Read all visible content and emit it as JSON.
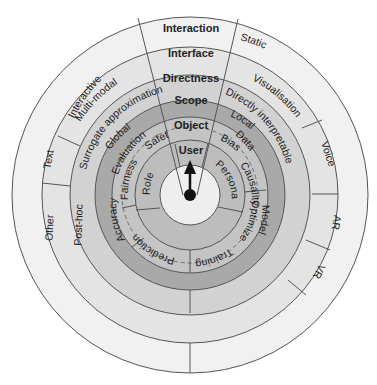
{
  "diagram": {
    "center": {
      "x": 190,
      "y": 195
    },
    "rings": [
      {
        "name": "interaction",
        "header": "Interaction",
        "r_outer": 178,
        "r_inner": 148,
        "fill": "#f1f1f1",
        "labels": [
          "Interactive",
          "Static"
        ]
      },
      {
        "name": "interface",
        "header": "Interface",
        "r_outer": 148,
        "r_inner": 120,
        "fill": "#e4e4e4",
        "labels": [
          "Multi-modal",
          "Visualisation",
          "Voice",
          "AR",
          "VR",
          "Text",
          "Other"
        ]
      },
      {
        "name": "directness",
        "header": "Directness",
        "r_outer": 120,
        "r_inner": 95,
        "fill": "#d2d2d2",
        "labels": [
          "Surrogate approximation",
          "Directly interpretable",
          "Post-hoc"
        ]
      },
      {
        "name": "scope",
        "header": "Scope",
        "r_outer": 95,
        "r_inner": 78,
        "fill": "#a9a9a9",
        "labels": [
          "Global",
          "Local"
        ]
      },
      {
        "name": "object",
        "header": "Object",
        "r_outer": 78,
        "r_inner": 55,
        "fill": "#c4c4c4",
        "labels": [
          "Evaluation",
          "Data",
          "Fairness",
          "Safety",
          "Bias",
          "Causality",
          "Accuracy",
          "Model",
          "Optimizer",
          "Training",
          "Prediction"
        ]
      },
      {
        "name": "user",
        "header": "User",
        "r_outer": 55,
        "r_inner": 30,
        "fill": "#bdbdbd",
        "labels": [
          "Role",
          "Persona"
        ]
      }
    ],
    "center_disc": {
      "fill": "#eeeeee",
      "pointer": "arrow-up"
    },
    "texts": {
      "interaction": "Interaction",
      "interface": "Interface",
      "directness": "Directness",
      "scope": "Scope",
      "object": "Object",
      "user": "User",
      "interactive": "Interactive",
      "static": "Static",
      "multimodal": "Multi-modal",
      "visualisation": "Visualisation",
      "voice": "Voice",
      "ar": "AR",
      "vr": "VR",
      "text": "Text",
      "other": "Other",
      "surrogate": "Surrogate approximation",
      "directly": "Directly interpretable",
      "posthoc": "Post-hoc",
      "global": "Global",
      "local": "Local",
      "evaluation": "Evaluation",
      "fairness": "Fairness",
      "safety": "Safety",
      "accuracy": "Accuracy",
      "data": "Data",
      "bias": "Bias",
      "causality": "Causality",
      "model": "Model",
      "optimizer": "Optimizer",
      "training": "Training",
      "prediction": "Prediction",
      "role": "Role",
      "persona": "Persona"
    },
    "colors": {
      "stroke": "#555555",
      "text": "#222222",
      "pointer": "#111111"
    }
  }
}
